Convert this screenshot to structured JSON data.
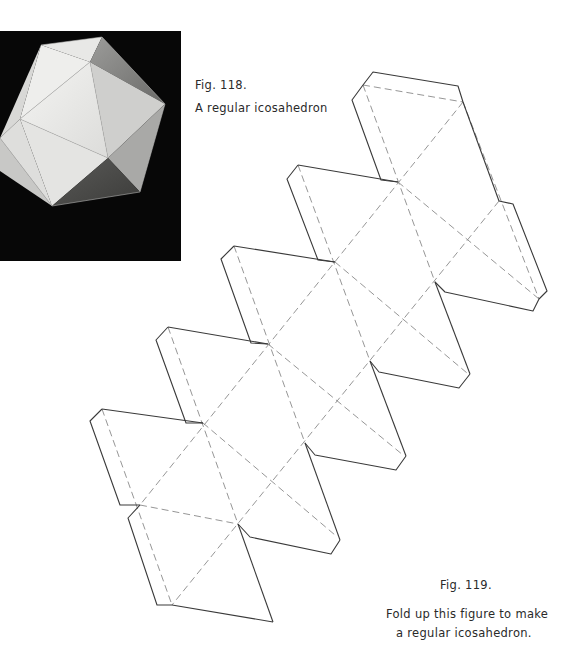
{
  "figure_118": {
    "label": "Fig. 118.",
    "caption": "A regular icosahedron",
    "image": "photograph of a white paper regular icosahedron model on a black background"
  },
  "figure_119": {
    "label": "Fig. 119.",
    "caption_line1": "Fold up this figure to make",
    "caption_line2": "a regular icosahedron.",
    "diagram": "net of a regular icosahedron: 20 equilateral triangles in a zigzag strip with glue tabs; dashed lines are fold lines, solid lines are cut lines"
  },
  "colors": {
    "background": "#ffffff",
    "photo_background": "#070707",
    "cut_line": "#3a3a3a",
    "fold_line": "#8a8a8a"
  }
}
